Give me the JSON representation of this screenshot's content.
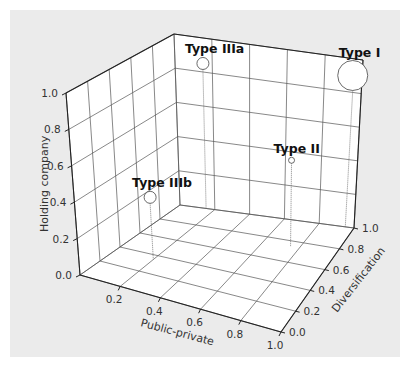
{
  "chart_data": {
    "type": "scatter3d",
    "title": "",
    "axes": {
      "x": {
        "label": "Public-private",
        "ticks": [
          "0.2",
          "0.4",
          "0.6",
          "0.8",
          "1.0"
        ],
        "range": [
          0,
          1
        ]
      },
      "y": {
        "label": "Diversification",
        "ticks": [
          "0.0",
          "0.2",
          "0.4",
          "0.6",
          "0.8",
          "1.0"
        ],
        "range": [
          0,
          1
        ]
      },
      "z": {
        "label": "Holding company",
        "ticks": [
          "0.0",
          "0.2",
          "0.4",
          "0.6",
          "0.8",
          "1.0"
        ],
        "range": [
          0,
          1
        ]
      }
    },
    "grid": true,
    "legend": null,
    "points": [
      {
        "label": "Type I",
        "public_private": 0.95,
        "diversification": 1.0,
        "holding_company": 0.9,
        "size": "large"
      },
      {
        "label": "Type IIIa",
        "public_private": 0.15,
        "diversification": 1.0,
        "holding_company": 0.85,
        "size": "small"
      },
      {
        "label": "Type II",
        "public_private": 0.75,
        "diversification": 0.75,
        "holding_company": 0.5,
        "size": "tiny"
      },
      {
        "label": "Type IIIb",
        "public_private": 0.2,
        "diversification": 0.35,
        "holding_company": 0.35,
        "size": "small"
      }
    ]
  }
}
